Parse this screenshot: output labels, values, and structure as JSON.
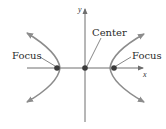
{
  "diagram": {
    "type": "hyperbola",
    "axes": {
      "x_label": "x",
      "y_label": "y"
    },
    "labels": {
      "left_focus": "Focus",
      "right_focus": "Focus",
      "center": "Center"
    },
    "points": {
      "center": {
        "x": 85,
        "y": 68
      },
      "left_focus": {
        "x": 57,
        "y": 68
      },
      "right_focus": {
        "x": 114,
        "y": 68
      },
      "left_vertex": {
        "x": 60,
        "y": 68
      },
      "right_vertex": {
        "x": 110,
        "y": 68
      }
    },
    "colors": {
      "curve": "#8c8c8c",
      "axis": "#6e6e6e",
      "point": "#3a3a3a",
      "text": "#2a2a2a"
    }
  }
}
